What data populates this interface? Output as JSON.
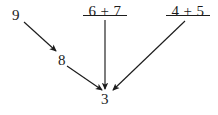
{
  "figure": {
    "type": "arrow-diagram",
    "background_color": "#ffffff",
    "ink_color": "#1c1c1c",
    "width": 218,
    "height": 115
  },
  "nodes": {
    "source_nine": {
      "text": "9",
      "x": 12,
      "y": 8
    },
    "intermediate_eight": {
      "text": "8",
      "x": 58,
      "y": 53
    },
    "target_three": {
      "text": "3",
      "x": 101,
      "y": 92
    }
  },
  "expressions": [
    {
      "id": "sum-six-plus-seven",
      "text": "6 + 7",
      "left": 83,
      "top": 4,
      "width": 44,
      "bar_top": 15,
      "has_bar": true
    },
    {
      "id": "sum-four-plus-five",
      "text": "4 + 5",
      "left": 166,
      "top": 4,
      "width": 44,
      "bar_top": 15,
      "has_bar": true
    }
  ],
  "arrows": [
    {
      "id": "arrow-nine-to-eight",
      "from": "9",
      "to": "8",
      "x1": 24,
      "y1": 22,
      "x2": 56,
      "y2": 51
    },
    {
      "id": "arrow-eight-to-three",
      "from": "8",
      "to": "3",
      "x1": 67,
      "y1": 66,
      "x2": 102,
      "y2": 90
    },
    {
      "id": "arrow-sum67-to-three",
      "from": "6 + 7",
      "to": "3",
      "x1": 105,
      "y1": 20,
      "x2": 105,
      "y2": 89
    },
    {
      "id": "arrow-sum45-to-three",
      "from": "4 + 5",
      "to": "3",
      "x1": 185,
      "y1": 21,
      "x2": 113,
      "y2": 90
    }
  ]
}
